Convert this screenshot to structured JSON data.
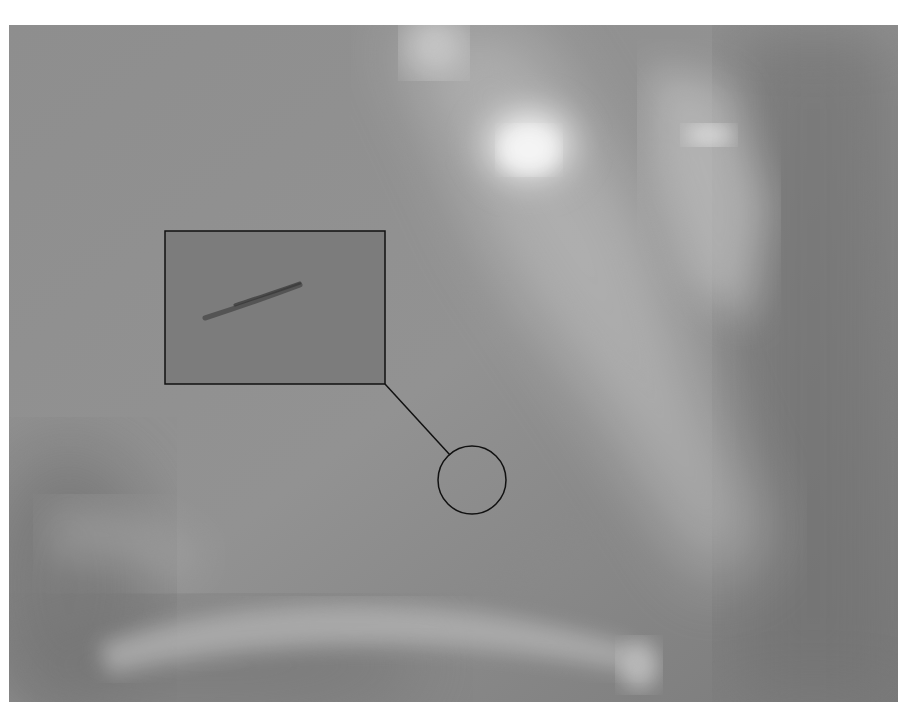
{
  "image": {
    "subject": "overcast sky with bright sun glare through clouds",
    "palette": {
      "sky_base": "#8c8c8c",
      "sky_dark": "#6e6e6e",
      "cloud_light": "#c8c8c8",
      "sun_glare": "#ffffff",
      "inset_fill": "#7b7b7b",
      "streak": "#444444",
      "annotation_stroke": "#111111"
    }
  },
  "annotation": {
    "inset_box": {
      "x": 165,
      "y": 231,
      "width": 220,
      "height": 153
    },
    "target_circle": {
      "cx": 472,
      "cy": 480,
      "r": 34
    },
    "leader_line": {
      "x1": 385,
      "y1": 384,
      "x2": 450,
      "y2": 455
    }
  }
}
